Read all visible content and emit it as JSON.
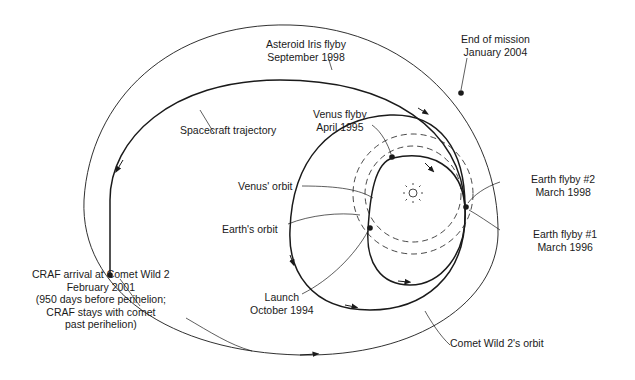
{
  "diagram": {
    "colors": {
      "line": "#1a1a1a",
      "background": "#ffffff"
    },
    "labels": {
      "asteroid_iris": [
        "Asteroid Iris flyby",
        "September 1998"
      ],
      "end_of_mission": [
        "End of mission",
        "January 2004"
      ],
      "spacecraft_trajectory": "Spacecraft trajectory",
      "venus_flyby": [
        "Venus flyby",
        "April 1995"
      ],
      "venus_orbit": "Venus' orbit",
      "earth_orbit": "Earth's orbit",
      "earth_flyby_2": [
        "Earth flyby #2",
        "March 1998"
      ],
      "earth_flyby_1": [
        "Earth flyby #1",
        "March 1996"
      ],
      "craf_arrival": [
        "CRAF arrival at Comet Wild 2",
        "February 2001",
        "(950 days before perihelion;",
        "CRAF stays with comet",
        "past perihelion)"
      ],
      "launch": [
        "Launch",
        "October 1994"
      ],
      "comet_orbit": "Comet Wild 2's orbit"
    },
    "elements": {
      "sun": "sun-icon",
      "orbits": [
        "venus-orbit",
        "earth-orbit",
        "comet-wild-2-orbit",
        "spacecraft-trajectory"
      ],
      "events": [
        "launch",
        "venus-flyby",
        "earth-flyby-1",
        "earth-flyby-2",
        "asteroid-iris-flyby",
        "craf-arrival",
        "end-of-mission"
      ]
    }
  }
}
